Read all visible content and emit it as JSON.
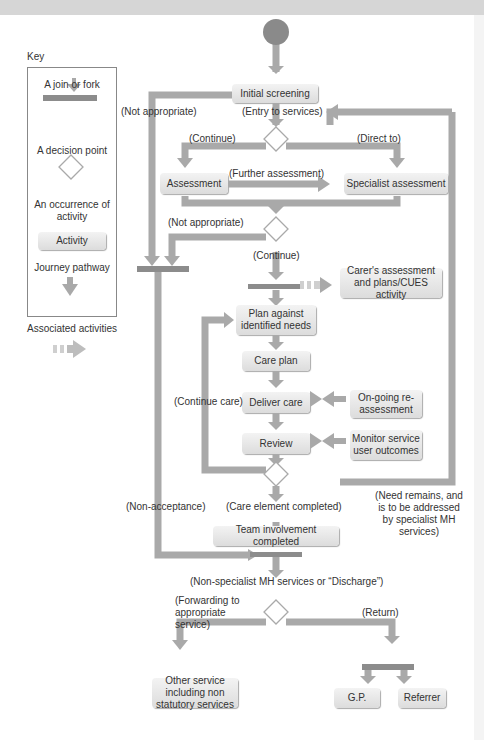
{
  "key": {
    "title": "Key",
    "items": [
      {
        "label": "A join or fork",
        "icon": "join-fork-bar"
      },
      {
        "label": "A decision point",
        "icon": "diamond"
      },
      {
        "label": "An occurrence of activity",
        "icon": "activity-box",
        "sample": "Activity"
      },
      {
        "label": "Journey pathway",
        "icon": "arrow-down"
      },
      {
        "label": "Associated activities",
        "icon": "dashed-arrow-right"
      }
    ]
  },
  "activities": {
    "initial_screening": "Initial screening",
    "assessment": "Assessment",
    "specialist_assessment": "Specialist assessment",
    "carers_assessment": "Carer's assessment and plans/CUES activity",
    "plan": "Plan against identified needs",
    "care_plan": "Care plan",
    "deliver_care": "Deliver care",
    "ongoing_reassessment": "On-going re-assessment",
    "review": "Review",
    "monitor": "Monitor service user outcomes",
    "team_involvement": "Team involvement completed",
    "other_service": "Other service including non statutory services",
    "gp": "G.P.",
    "referrer": "Referrer"
  },
  "labels": {
    "not_appropriate_1": "(Not appropriate)",
    "entry": "(Entry to services)",
    "continue": "(Continue)",
    "direct_to": "(Direct to)",
    "further_assessment": "(Further assessment)",
    "not_appropriate_2": "(Not appropriate)",
    "continue_2": "(Continue)",
    "continue_care": "(Continue care)",
    "non_acceptance": "(Non-acceptance)",
    "care_element_completed": "(Care element completed)",
    "need_remains": "(Need remains, and is to be addressed by specialist MH services)",
    "non_specialist": "(Non-specialist MH services or “Discharge”)",
    "forwarding": "(Forwarding to appropriate service)",
    "return": "(Return)"
  },
  "colors": {
    "pathway": "#a9a9a9",
    "bar": "#8c8c8c",
    "start_node": "#8a8a8a",
    "activity_fill": "#e6e6e6"
  }
}
